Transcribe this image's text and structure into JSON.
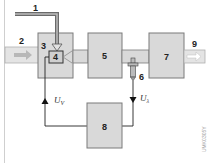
{
  "diagram": {
    "labels": {
      "pipe_secondary_air": "1",
      "pipe_inlet": "2",
      "block_housing": "3",
      "block_valve": "4",
      "block_engine": "5",
      "sensor": "6",
      "block_converter": "7",
      "controller": "8",
      "outlet": "9"
    },
    "signals": {
      "control_signal": "U",
      "control_signal_sub": "V",
      "sensor_signal": "U",
      "sensor_signal_sub": "λ"
    },
    "watermark": "UMK0305Y",
    "colors": {
      "block_fill": "#d9d9d9",
      "block_stroke": "#7a7a7a",
      "pipe_fill": "#e6e6e6",
      "pipe_dark": "#8a8a8a",
      "line": "#222222"
    }
  }
}
